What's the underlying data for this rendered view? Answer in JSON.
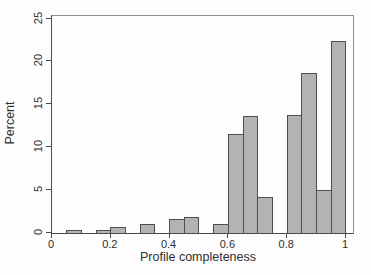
{
  "chart_data": {
    "type": "bar",
    "subtype": "histogram",
    "title": "",
    "xlabel": "Profile completeness",
    "ylabel": "Percent",
    "xlim": [
      0,
      1.024
    ],
    "ylim": [
      0,
      25.3
    ],
    "grid": false,
    "legend": "none",
    "x_ticks": [
      0,
      0.2,
      0.4,
      0.6,
      0.8,
      1
    ],
    "x_tick_labels": [
      "0",
      "0.2",
      "0.4",
      "0.6",
      "0.8",
      "1"
    ],
    "y_ticks": [
      0,
      5,
      10,
      15,
      20,
      25
    ],
    "y_tick_labels": [
      "0",
      "5",
      "10",
      "15",
      "20",
      "25"
    ],
    "bin_width": 0.05,
    "bins": [
      {
        "start": 0.05,
        "percent": 0.3
      },
      {
        "start": 0.15,
        "percent": 0.3
      },
      {
        "start": 0.2,
        "percent": 0.7
      },
      {
        "start": 0.3,
        "percent": 1.0
      },
      {
        "start": 0.4,
        "percent": 1.6
      },
      {
        "start": 0.45,
        "percent": 1.9
      },
      {
        "start": 0.55,
        "percent": 1.0
      },
      {
        "start": 0.6,
        "percent": 11.5
      },
      {
        "start": 0.65,
        "percent": 13.6
      },
      {
        "start": 0.7,
        "percent": 4.2
      },
      {
        "start": 0.8,
        "percent": 13.8
      },
      {
        "start": 0.85,
        "percent": 18.6
      },
      {
        "start": 0.9,
        "percent": 5.0
      },
      {
        "start": 0.95,
        "percent": 22.4
      }
    ],
    "colors": {
      "bar_fill": "#b3b3b3",
      "bar_border": "#4f4f4f",
      "axis_line": "#4a4a4a",
      "frame_line": "#8f8f8f",
      "text": "#2e2e2e",
      "background": "#fdfdfd"
    }
  }
}
